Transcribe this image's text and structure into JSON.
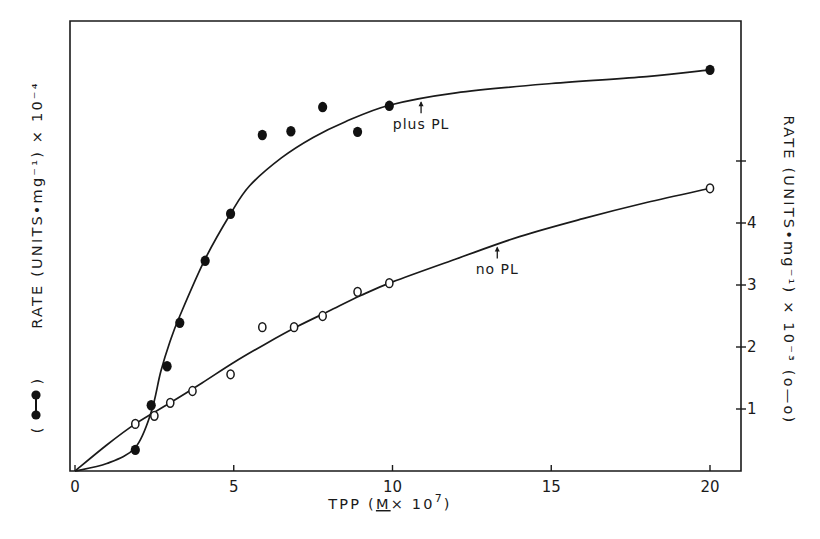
{
  "chart_data": {
    "type": "scatter",
    "title": "",
    "xlabel": "TPP (M × 10^7)",
    "xlabel_parts": {
      "prefix": "TPP (",
      "underlined": "M",
      "middle": "× 10",
      "sup": "7",
      "suffix": ")"
    },
    "xlim": [
      0,
      21
    ],
    "xticks": [
      0,
      5,
      10,
      15,
      20
    ],
    "xtick_labels": [
      "0",
      "5",
      "10",
      "15",
      "20"
    ],
    "ylabel_left": "RATE (UNITS•mg⁻¹) × 10⁻⁴",
    "ylabel_left_legend": "(●—●)",
    "ylabel_right": "RATE (UNITS•mg⁻¹) × 10⁻³ (o—o)",
    "ylim": [
      0,
      7.25
    ],
    "yticks_right": [
      1,
      2,
      3,
      4,
      5
    ],
    "ytick_labels_right": [
      "1",
      "2",
      "3",
      "4",
      ""
    ],
    "yticks_left": [],
    "grid": false,
    "legend": "axis-labels",
    "series": [
      {
        "name": "plus PL",
        "marker": "filled-circle",
        "axis": "left",
        "points": [
          [
            1.9,
            0.34
          ],
          [
            2.4,
            1.06
          ],
          [
            2.9,
            1.69
          ],
          [
            3.3,
            2.39
          ],
          [
            4.1,
            3.39
          ],
          [
            4.9,
            4.15
          ],
          [
            5.9,
            5.42
          ],
          [
            6.8,
            5.48
          ],
          [
            7.8,
            5.87
          ],
          [
            8.9,
            5.47
          ],
          [
            9.9,
            5.89
          ],
          [
            20.0,
            6.47
          ]
        ],
        "curve": [
          [
            0,
            0
          ],
          [
            1.0,
            0.12
          ],
          [
            1.9,
            0.38
          ],
          [
            2.4,
            0.95
          ],
          [
            2.7,
            1.6
          ],
          [
            3.0,
            2.1
          ],
          [
            3.3,
            2.5
          ],
          [
            4.1,
            3.42
          ],
          [
            4.9,
            4.15
          ],
          [
            5.5,
            4.6
          ],
          [
            6.5,
            5.05
          ],
          [
            7.5,
            5.38
          ],
          [
            8.5,
            5.63
          ],
          [
            9.9,
            5.9
          ],
          [
            12,
            6.1
          ],
          [
            15,
            6.25
          ],
          [
            18,
            6.36
          ],
          [
            20,
            6.47
          ]
        ],
        "annotation": {
          "text": "plus PL",
          "x": 10.9
        }
      },
      {
        "name": "no PL",
        "marker": "open-circle",
        "axis": "right",
        "points": [
          [
            1.9,
            0.76
          ],
          [
            2.5,
            0.89
          ],
          [
            3.0,
            1.1
          ],
          [
            3.7,
            1.29
          ],
          [
            4.9,
            1.56
          ],
          [
            5.9,
            2.32
          ],
          [
            6.9,
            2.32
          ],
          [
            7.8,
            2.5
          ],
          [
            8.9,
            2.89
          ],
          [
            9.9,
            3.03
          ],
          [
            20.0,
            4.56
          ]
        ],
        "curve": [
          [
            0,
            0
          ],
          [
            1.0,
            0.42
          ],
          [
            1.9,
            0.76
          ],
          [
            3.0,
            1.1
          ],
          [
            4.0,
            1.42
          ],
          [
            5.0,
            1.75
          ],
          [
            6.0,
            2.05
          ],
          [
            7.0,
            2.33
          ],
          [
            8.0,
            2.58
          ],
          [
            9.0,
            2.83
          ],
          [
            10.0,
            3.05
          ],
          [
            12.0,
            3.42
          ],
          [
            14.0,
            3.78
          ],
          [
            16.0,
            4.07
          ],
          [
            18.0,
            4.33
          ],
          [
            20.0,
            4.56
          ]
        ],
        "annotation": {
          "text": "no PL",
          "x": 13.3
        }
      }
    ]
  }
}
